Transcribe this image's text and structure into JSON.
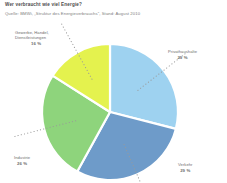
{
  "header": {
    "title": "Wer verbraucht wie viel Energie?",
    "subtitle": "Quelle: BMWi, „Struktur des Energieverbrauchs“, Stand: August 2010"
  },
  "labels": {
    "privathaushalte": {
      "name": "Privathaushalte",
      "value": "29 %"
    },
    "verkehr": {
      "name": "Verkehr",
      "value": "29 %"
    },
    "industrie": {
      "name": "Industrie",
      "value": "26 %"
    },
    "gewerbe": {
      "name_line1": "Gewerbe, Handel,",
      "name_line2": "Dienstleistungen",
      "value": "16 %"
    }
  },
  "chart_data": {
    "type": "pie",
    "title": "Wer verbraucht wie viel Energie?",
    "subtitle": "Quelle: BMWi, „Struktur des Energieverbrauchs“, Stand: August 2010",
    "categories": [
      "Privathaushalte",
      "Verkehr",
      "Industrie",
      "Gewerbe, Handel, Dienstleistungen"
    ],
    "values": [
      29,
      29,
      26,
      16
    ],
    "value_labels": [
      "29 %",
      "29 %",
      "26 %",
      "16 %"
    ],
    "unit": "%",
    "colors": [
      "#9ed2f0",
      "#6e9bc9",
      "#8ed47c",
      "#e4f24e"
    ],
    "start_angle_deg": 0,
    "direction": "clockwise",
    "slice_gap": true,
    "gap_color": "#ffffff",
    "legend": "none",
    "labels_position": "outside-with-dotted-leader",
    "leader_color": "#9a9a9a",
    "grid": false,
    "center": [
      110,
      112
    ],
    "radius": 68
  },
  "style": {
    "background": "#ffffff",
    "title_color": "#4b4b4b",
    "subtitle_color": "#7d7d7d",
    "label_color": "#6d6d6d"
  }
}
